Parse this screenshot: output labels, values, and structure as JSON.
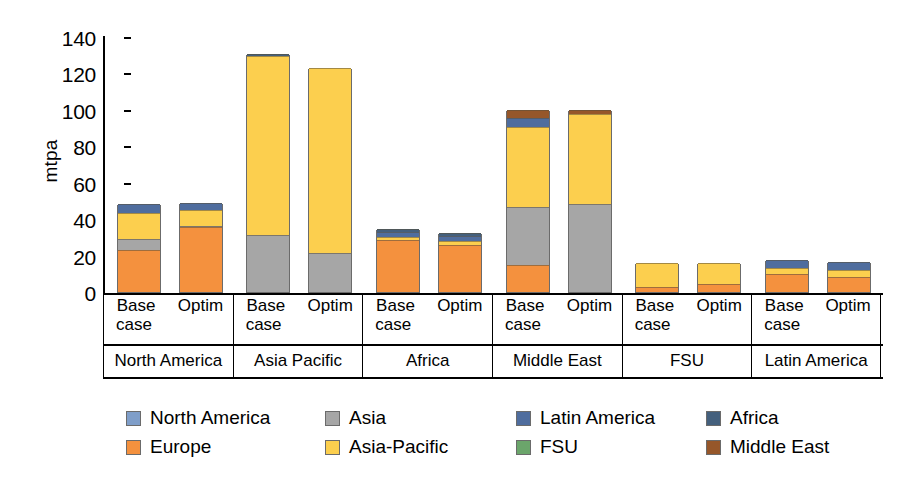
{
  "chart_data": {
    "type": "bar",
    "stacked": true,
    "title": "",
    "xlabel": "",
    "ylabel": "mtpa",
    "ylim": [
      0,
      140
    ],
    "yticks": [
      0,
      20,
      40,
      60,
      80,
      100,
      120,
      140
    ],
    "grid": false,
    "legend_position": "bottom",
    "groups": [
      "North America",
      "Asia Pacific",
      "Africa",
      "Middle East",
      "FSU",
      "Latin America"
    ],
    "subcategories": [
      {
        "line1": "Base",
        "line2": "case"
      },
      {
        "line1": "Optim",
        "line2": ""
      }
    ],
    "series": [
      {
        "name": "North America",
        "color": "#7f9ec9",
        "values": [
          0,
          0,
          0,
          0,
          0,
          0,
          0,
          0,
          0,
          0,
          0,
          0
        ]
      },
      {
        "name": "Europe",
        "color": "#f4913e",
        "values": [
          23.0,
          35.5,
          0,
          0,
          28.8,
          26.0,
          14.8,
          0,
          2.5,
          4.5,
          10.0,
          8.5
        ]
      },
      {
        "name": "Asia",
        "color": "#a6a6a6",
        "values": [
          6.0,
          1.0,
          31.5,
          21.5,
          0,
          0,
          32.0,
          48.5,
          0,
          0,
          0,
          0
        ]
      },
      {
        "name": "Asia-Pacific",
        "color": "#fccf4e",
        "values": [
          14.5,
          8.5,
          98.0,
          101.5,
          1.2,
          2.0,
          44.0,
          49.0,
          13.5,
          11.5,
          3.0,
          3.5
        ]
      },
      {
        "name": "Latin America",
        "color": "#4f6d9e",
        "values": [
          5.0,
          4.0,
          0,
          0,
          3.2,
          3.0,
          5.0,
          0,
          0,
          0,
          4.5,
          4.5
        ]
      },
      {
        "name": "FSU",
        "color": "#6ba56b",
        "values": [
          0,
          0,
          0,
          0,
          0,
          0,
          0,
          0,
          0,
          0,
          0,
          0
        ]
      },
      {
        "name": "Africa",
        "color": "#44607d",
        "values": [
          0,
          0,
          1.0,
          0,
          1.3,
          1.2,
          0,
          0,
          0,
          0,
          0,
          0
        ]
      },
      {
        "name": "Middle East",
        "color": "#96572a",
        "values": [
          0,
          0,
          0,
          0,
          0,
          0,
          4.0,
          2.5,
          0,
          0,
          0,
          0
        ]
      }
    ],
    "bar_totals": [
      48.5,
      49.0,
      130.5,
      123.0,
      34.5,
      32.2,
      99.8,
      100.0,
      16.0,
      16.0,
      17.5,
      16.5
    ]
  },
  "legend": {
    "items": [
      {
        "label": "North America",
        "color": "#7f9ec9"
      },
      {
        "label": "Asia",
        "color": "#a6a6a6"
      },
      {
        "label": "Latin America",
        "color": "#4f6d9e"
      },
      {
        "label": "Africa",
        "color": "#44607d"
      },
      {
        "label": "Europe",
        "color": "#f4913e"
      },
      {
        "label": "Asia-Pacific",
        "color": "#fccf4e"
      },
      {
        "label": "FSU",
        "color": "#6ba56b"
      },
      {
        "label": "Middle East",
        "color": "#96572a"
      }
    ]
  }
}
